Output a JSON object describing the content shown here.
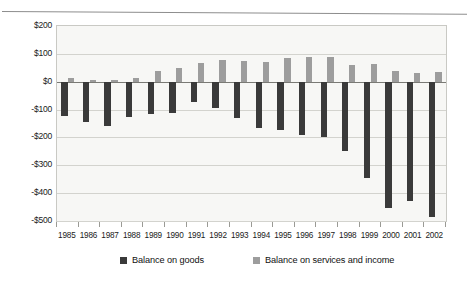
{
  "chart_data": {
    "type": "bar",
    "title": "",
    "subtitle": "",
    "xlabel": "",
    "ylabel": "",
    "grid": true,
    "legend_position": "bottom",
    "ylim": [
      -500,
      200
    ],
    "ytick_step": 100,
    "ytick_labels": [
      "$200",
      "$100",
      "$0",
      "-$100",
      "-$200",
      "-$300",
      "-$400",
      "-$500"
    ],
    "ytick_values": [
      200,
      100,
      0,
      -100,
      -200,
      -300,
      -400,
      -500
    ],
    "categories": [
      "1985",
      "1986",
      "1987",
      "1988",
      "1989",
      "1990",
      "1991",
      "1992",
      "1993",
      "1994",
      "1995",
      "1996",
      "1997",
      "1998",
      "1999",
      "2000",
      "2001",
      "2002"
    ],
    "series": [
      {
        "name": "Balance on goods",
        "color": "#3a3a3a",
        "values": [
          -122,
          -145,
          -160,
          -127,
          -116,
          -111,
          -74,
          -96,
          -132,
          -166,
          -174,
          -191,
          -198,
          -247,
          -346,
          -452,
          -427,
          -484
        ]
      },
      {
        "name": "Balance on services and income",
        "color": "#9d9d9d",
        "values": [
          12,
          6,
          5,
          14,
          38,
          51,
          68,
          78,
          76,
          71,
          84,
          89,
          87,
          60,
          63,
          40,
          31,
          34
        ]
      }
    ]
  },
  "legend": {
    "items": [
      {
        "label": "Balance on goods",
        "color": "#3a3a3a",
        "swatch_name": "legend-swatch-goods"
      },
      {
        "label": "Balance on services and income",
        "color": "#9d9d9d",
        "swatch_name": "legend-swatch-services"
      }
    ]
  }
}
